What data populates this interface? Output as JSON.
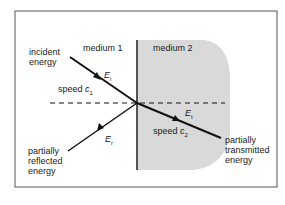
{
  "diagram": {
    "medium1_label": "medium 1",
    "medium2_label": "medium 2",
    "incident_label": [
      "incident",
      "energy"
    ],
    "reflected_label": [
      "partially",
      "reflected",
      "energy"
    ],
    "transmitted_label": [
      "partially",
      "transmitted",
      "energy"
    ],
    "speed1": {
      "text": "speed ",
      "symbol": "c",
      "sub": "1"
    },
    "speed2": {
      "text": "speed ",
      "symbol": "c",
      "sub": "2"
    },
    "incident_symbol": {
      "symbol": "E",
      "sub": "i"
    },
    "reflected_symbol": {
      "symbol": "E",
      "sub": "r"
    },
    "transmitted_symbol": {
      "symbol": "E",
      "sub": "t"
    },
    "colors": {
      "medium2_fill": "#d9d9d9",
      "line": "#111111",
      "frame": "#555555"
    }
  }
}
